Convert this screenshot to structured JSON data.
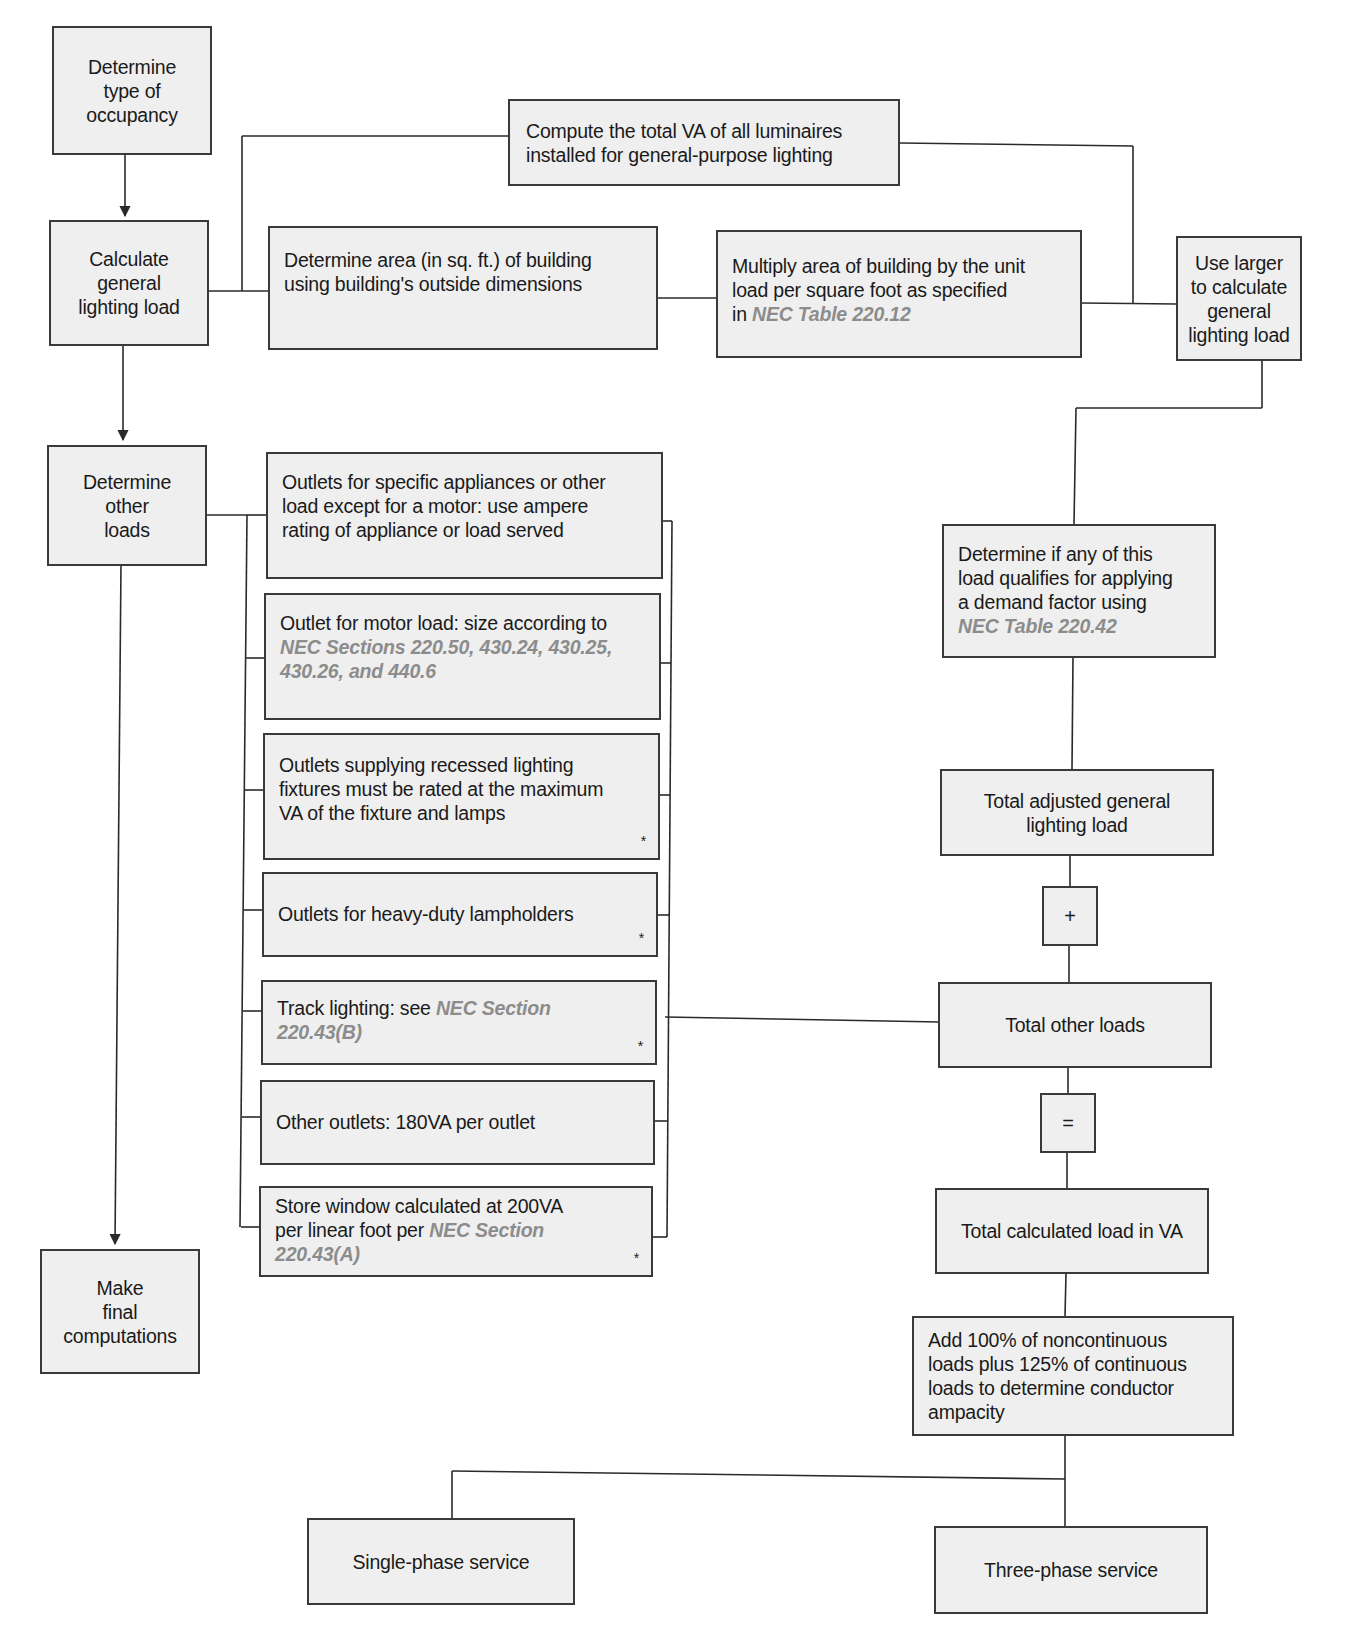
{
  "left_column": {
    "occupancy": "Determine\ntype of\noccupancy",
    "general_lighting": "Calculate\ngeneral\nlighting load",
    "other_loads": "Determine\nother\nloads",
    "final": "Make\nfinal\ncomputations"
  },
  "lighting_branch": {
    "compute_luminaires": "Compute the total VA of all luminaires\ninstalled for general-purpose lighting",
    "determine_area": "Determine area (in sq. ft.) of building\nusing building's outside dimensions",
    "multiply_area": {
      "text": "Multiply area of building by the unit\nload per square foot as specified\nin ",
      "ref": "NEC Table 220.12"
    },
    "use_larger": "Use larger\nto calculate\ngeneral\nlighting load"
  },
  "other_loads_list": [
    {
      "text": "Outlets for specific appliances or other\nload except for a motor: use ampere\nrating of appliance or load served",
      "ref": "",
      "star": ""
    },
    {
      "text": "Outlet for motor load: size according to\n",
      "ref": "NEC Sections 220.50, 430.24, 430.25,\n430.26, and 440.6",
      "star": ""
    },
    {
      "text": "Outlets supplying recessed lighting\nfixtures must be rated at the maximum\nVA of the fixture and lamps",
      "ref": "",
      "star": "*"
    },
    {
      "text": "Outlets for heavy-duty lampholders",
      "ref": "",
      "star": "*"
    },
    {
      "text": "Track lighting: see ",
      "ref": "NEC Section\n220.43(B)",
      "star": "*"
    },
    {
      "text": "Other outlets: 180VA per outlet",
      "ref": "",
      "star": ""
    },
    {
      "text": "Store window calculated at 200VA\nper linear foot per ",
      "ref": "NEC Section\n220.43(A)",
      "star": "*"
    }
  ],
  "right_column": {
    "demand_factor": {
      "text": "Determine if any of this\nload qualifies for applying\na demand factor using\n",
      "ref": "NEC Table 220.42"
    },
    "total_adjusted": "Total adjusted general\nlighting load",
    "plus_operator": "+",
    "total_other": "Total other loads",
    "equals_operator": "=",
    "total_calculated": "Total calculated load in VA",
    "conductor_ampacity": "Add 100% of noncontinuous\nloads plus 125% of continuous\nloads to determine conductor\nampacity"
  },
  "services": {
    "single_phase": "Single-phase service",
    "three_phase": "Three-phase service"
  },
  "colors": {
    "box_fill": "#efefef",
    "box_border": "#3a3a3a",
    "reference_text": "#8c8c8c",
    "line": "#2a2a2a"
  }
}
